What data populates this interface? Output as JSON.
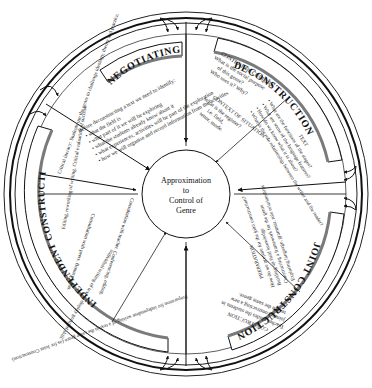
{
  "diagram": {
    "type": "teaching-learning-cycle-wheel",
    "center": {
      "lines": [
        "Approximation",
        "to",
        "Control of",
        "Genre"
      ]
    },
    "stages": [
      {
        "id": "negotiating-field",
        "title": "NEGOTIATING FIELD",
        "intro": "Before deconstructing a text we need to identify:",
        "bullets": [
          "what the field is",
          "what part of it we will be exploring",
          "what the students already know about it",
          "what experiences, activities will be part of the exploration",
          "how we will organise and record information from the activities"
        ]
      },
      {
        "id": "deconstruction",
        "title": "DECONSTRUCTION",
        "context_culture": {
          "heading": "CONTEXT OF CULTURE",
          "lines": [
            "What is the social purpose",
            "of this genre?",
            "Who uses it? Why?"
          ]
        },
        "context_situation": {
          "heading": "CONTEXT OF SITUATION",
          "lines": [
            "What is the register?",
            "i.e. field,",
            "tenor, mode."
          ]
        },
        "text": {
          "heading": "TEXT",
          "bullets": [
            "What are the functions of the stages?",
            "What are some of the language features?",
            "How do we know what it is about?",
            "What is the role relationship between the writer and the reader?"
          ]
        }
      },
      {
        "id": "joint-construction",
        "title": "JOINT CONSTRUCTION",
        "preparation": {
          "heading": "PREPARATION",
          "lines": [
            "How do we prepare for the joint construction?",
            "Building up field knowledge",
            "Constructing a framework for the genre",
            "Exploring language, grammar, role relationships"
          ]
        },
        "construction": {
          "heading": "CONSTRUCTION",
          "lines": [
            "Teacher guides the students in",
            "jointly constructing a new",
            "text in the same genre."
          ]
        }
      },
      {
        "id": "independent-construction",
        "title": "INDEPENDENT CONSTRUCTION",
        "preparation_note": "Preparation for independent writing of a text in the same genre (as for Joint Construction).",
        "individual": "Individual writing of text to display grasp of skill.",
        "consultation": "Consultation with teacher. Conferencing, editing.",
        "consultation_peers": "Consultation with peers. Bounce ideas.",
        "editing": "Editing, reworking of writing. Critical evaluation of success.",
        "critical_literacy": "Critical literacy: Students use the genre to challenge ideology, theory and practice."
      }
    ],
    "colors": {
      "ink": "#111111",
      "banner_shadow": "#7a7a7a",
      "background": "#ffffff"
    }
  }
}
